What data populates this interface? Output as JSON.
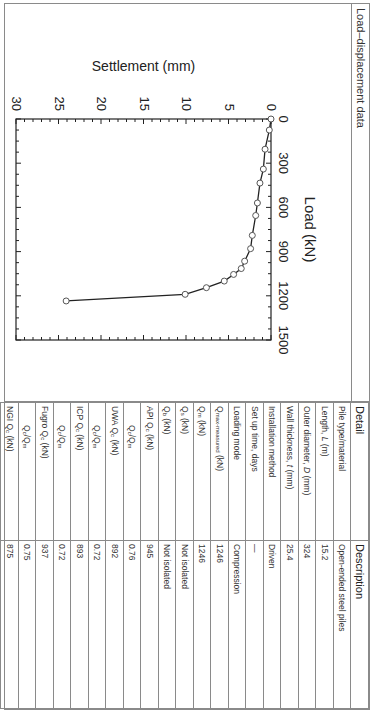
{
  "panel": {
    "title": "Load–displacement data"
  },
  "table": {
    "headers": [
      "Detail",
      "Description"
    ],
    "rows": [
      {
        "detail": "Pile type/material",
        "description": "Open-ended steel piles",
        "indent": false
      },
      {
        "detail": "Length, L (m)",
        "description": "15.2",
        "indent": false
      },
      {
        "detail": "Outer diameter, D (mm)",
        "description": "324",
        "indent": false
      },
      {
        "detail": "Wall thickness, t (mm)",
        "description": "25.4",
        "indent": false
      },
      {
        "detail": "Installation method",
        "description": "Driven",
        "indent": false
      },
      {
        "detail": "Set up time, days",
        "description": "—",
        "indent": false
      },
      {
        "detail": "Loading mode",
        "description": "Compression",
        "indent": false
      },
      {
        "detail": "Q_max-measured (kN)",
        "description": "1246",
        "indent": false
      },
      {
        "detail": "Q_m (kN)",
        "description": "1246",
        "indent": false
      },
      {
        "detail": "Q_s (kN)",
        "description": "Not isolated",
        "indent": false
      },
      {
        "detail": "Q_b (kN)",
        "description": "Not isolated",
        "indent": false
      },
      {
        "detail": "API Q_c (kN)",
        "description": "945",
        "indent": false
      },
      {
        "detail": "Q_c/Q_m",
        "description": "0.76",
        "indent": true
      },
      {
        "detail": "UWA Q_c (kN)",
        "description": "892",
        "indent": false
      },
      {
        "detail": "Q_c/Q_m",
        "description": "0.72",
        "indent": true
      },
      {
        "detail": "ICP Q_c (kN)",
        "description": "893",
        "indent": false
      },
      {
        "detail": "Q_c/Q_m",
        "description": "0.72",
        "indent": true
      },
      {
        "detail": "Fugro Q_c (kN)",
        "description": "937",
        "indent": false
      },
      {
        "detail": "Q_c/Q_m",
        "description": "0.75",
        "indent": true
      },
      {
        "detail": "NGI Q_c (kN)",
        "description": "875",
        "indent": false
      },
      {
        "detail": "Q_c/Q_m",
        "description": "0.70",
        "indent": true
      }
    ]
  },
  "chart_data": {
    "type": "line",
    "title": "",
    "xlabel": "Load (kN)",
    "ylabel": "Settlement (mm)",
    "xlim": [
      0,
      1500
    ],
    "ylim": [
      0,
      30
    ],
    "y_inverted": true,
    "x_ticks": [
      0,
      300,
      600,
      900,
      1200,
      1500
    ],
    "y_ticks": [
      0,
      5,
      10,
      15,
      20,
      25,
      30
    ],
    "x_axis_position": "top",
    "grid": false,
    "marker": "open-circle",
    "series": [
      {
        "name": "Load-displacement",
        "x": [
          0,
          75,
          205,
          340,
          435,
          570,
          655,
          790,
          880,
          965,
          1015,
          1055,
          1100,
          1145,
          1190,
          1235
        ],
        "y": [
          0,
          0.2,
          0.7,
          0.9,
          1.3,
          1.6,
          1.8,
          2.2,
          2.4,
          3.1,
          3.5,
          4.4,
          5.5,
          7.6,
          10.1,
          24.1
        ]
      }
    ]
  }
}
